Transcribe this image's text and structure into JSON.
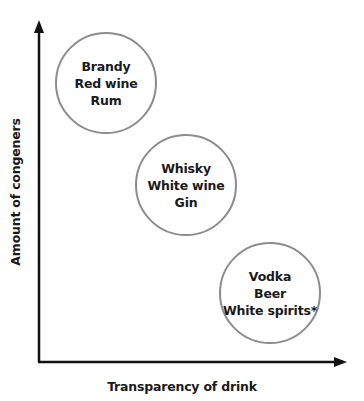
{
  "diagram": {
    "x_axis_label": "Transparency of drink",
    "y_axis_label": "Amount of congeners",
    "groups": [
      {
        "lines": [
          "Brandy",
          "Red wine",
          "Rum"
        ],
        "level": "high congeners, low transparency"
      },
      {
        "lines": [
          "Whisky",
          "White wine",
          "Gin"
        ],
        "level": "medium"
      },
      {
        "lines": [
          "Vodka",
          "Beer",
          "White spirits*"
        ],
        "level": "low congeners, high transparency"
      }
    ],
    "colors": {
      "axis": "#111111",
      "circle_border": "#8c8c8c",
      "text": "#1a1a1a"
    }
  }
}
